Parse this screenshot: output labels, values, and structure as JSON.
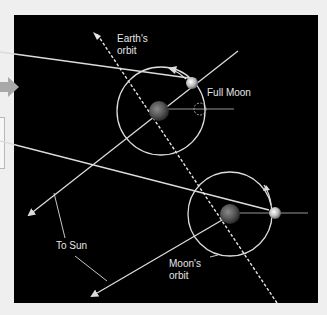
{
  "diagram": {
    "labels": {
      "earths_orbit": [
        "Earth's",
        "orbit"
      ],
      "full_moon": "Full Moon",
      "to_sun": "To Sun",
      "moons_orbit": [
        "Moon's",
        "orbit"
      ]
    },
    "colors": {
      "background": "#000000",
      "page": "#efefef",
      "lines": "#e0e0e0",
      "arrow_left": "#a8a8a8"
    },
    "icons": [
      "earth-icon",
      "moon-icon",
      "arrow-right-icon"
    ]
  }
}
